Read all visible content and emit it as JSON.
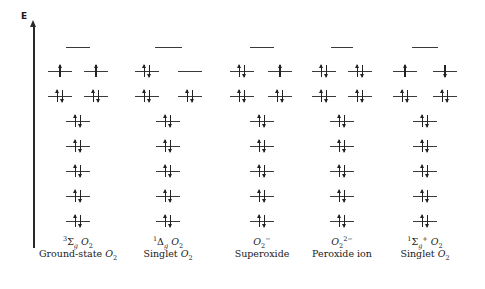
{
  "axis": {
    "label": "E",
    "direction": "up"
  },
  "level_rows_y": {
    "lumo": 47,
    "pi_star": 71,
    "pi": 96,
    "lower": [
      121,
      146,
      171,
      196,
      221
    ]
  },
  "columns": [
    {
      "id": "ground-state-o2",
      "term_symbol": {
        "pre_sup": "3",
        "symbol": "Σ",
        "sub": "g",
        "post_sup": "",
        "species": "O",
        "species_sub": "2",
        "species_sup": ""
      },
      "name": "Ground-state O₂",
      "name_text": "Ground-state ",
      "center_x": 78,
      "lumo": {
        "x1": 66,
        "x2": 90
      },
      "pi_star": [
        {
          "cx": 60,
          "spins": [
            "up"
          ]
        },
        {
          "cx": 96,
          "spins": [
            "up"
          ]
        }
      ],
      "pi": [
        {
          "cx": 60,
          "spins": [
            "up",
            "down"
          ]
        },
        {
          "cx": 96,
          "spins": [
            "up",
            "down"
          ]
        }
      ],
      "lower_cx": 78,
      "lower": [
        [
          "up",
          "down"
        ],
        [
          "up",
          "down"
        ],
        [
          "up",
          "down"
        ],
        [
          "up",
          "down"
        ],
        [
          "up",
          "down"
        ]
      ]
    },
    {
      "id": "singlet-delta-o2",
      "term_symbol": {
        "pre_sup": "1",
        "symbol": "Δ",
        "sub": "g",
        "post_sup": "",
        "species": "O",
        "species_sub": "2",
        "species_sup": ""
      },
      "name": "Singlet O₂",
      "name_text": "Singlet ",
      "center_x": 168,
      "lumo": {
        "x1": 155,
        "x2": 182
      },
      "pi_star": [
        {
          "cx": 147,
          "spins": [
            "up",
            "down"
          ]
        },
        {
          "cx": 190,
          "spins": []
        }
      ],
      "pi": [
        {
          "cx": 147,
          "spins": [
            "up",
            "down"
          ]
        },
        {
          "cx": 190,
          "spins": [
            "up",
            "down"
          ]
        }
      ],
      "lower_cx": 168,
      "lower": [
        [
          "up",
          "down"
        ],
        [
          "up",
          "down"
        ],
        [
          "up",
          "down"
        ],
        [
          "up",
          "down"
        ],
        [
          "up",
          "down"
        ]
      ]
    },
    {
      "id": "superoxide",
      "term_symbol": {
        "pre_sup": "",
        "symbol": "",
        "sub": "",
        "post_sup": "",
        "species": "O",
        "species_sub": "2",
        "species_sup": "−"
      },
      "name": "Superoxide",
      "name_text": "Superoxide",
      "center_x": 262,
      "lumo": {
        "x1": 250,
        "x2": 274
      },
      "pi_star": [
        {
          "cx": 242,
          "spins": [
            "up",
            "down"
          ]
        },
        {
          "cx": 280,
          "spins": [
            "up"
          ]
        }
      ],
      "pi": [
        {
          "cx": 242,
          "spins": [
            "up",
            "down"
          ]
        },
        {
          "cx": 280,
          "spins": [
            "up",
            "down"
          ]
        }
      ],
      "lower_cx": 262,
      "lower": [
        [
          "up",
          "down"
        ],
        [
          "up",
          "down"
        ],
        [
          "up",
          "down"
        ],
        [
          "up",
          "down"
        ],
        [
          "up",
          "down"
        ]
      ]
    },
    {
      "id": "peroxide-ion",
      "term_symbol": {
        "pre_sup": "",
        "symbol": "",
        "sub": "",
        "post_sup": "",
        "species": "O",
        "species_sub": "2",
        "species_sup": "2−"
      },
      "name": "Peroxide ion",
      "name_text": "Peroxide ion",
      "center_x": 342,
      "lumo": {
        "x1": 331,
        "x2": 353
      },
      "pi_star": [
        {
          "cx": 324,
          "spins": [
            "up",
            "down"
          ]
        },
        {
          "cx": 360,
          "spins": [
            "up",
            "down"
          ]
        }
      ],
      "pi": [
        {
          "cx": 324,
          "spins": [
            "up",
            "down"
          ]
        },
        {
          "cx": 360,
          "spins": [
            "up",
            "down"
          ]
        }
      ],
      "lower_cx": 342,
      "lower": [
        [
          "up",
          "down"
        ],
        [
          "up",
          "down"
        ],
        [
          "up",
          "down"
        ],
        [
          "up",
          "down"
        ],
        [
          "up",
          "down"
        ]
      ]
    },
    {
      "id": "singlet-sigma-o2",
      "term_symbol": {
        "pre_sup": "1",
        "symbol": "Σ",
        "sub": "g",
        "post_sup": "+",
        "species": "O",
        "species_sub": "2",
        "species_sup": ""
      },
      "name": "Singlet O₂",
      "name_text": "Singlet ",
      "center_x": 425,
      "lumo": {
        "x1": 412,
        "x2": 438
      },
      "pi_star": [
        {
          "cx": 405,
          "spins": [
            "up"
          ]
        },
        {
          "cx": 445,
          "spins": [
            "down"
          ]
        }
      ],
      "pi": [
        {
          "cx": 405,
          "spins": [
            "up",
            "down"
          ]
        },
        {
          "cx": 445,
          "spins": [
            "up",
            "down"
          ]
        }
      ],
      "lower_cx": 425,
      "lower": [
        [
          "up",
          "down"
        ],
        [
          "up",
          "down"
        ],
        [
          "up",
          "down"
        ],
        [
          "up",
          "down"
        ],
        [
          "up",
          "down"
        ]
      ]
    }
  ],
  "label_rows_y": {
    "term": 243,
    "name": 256
  }
}
